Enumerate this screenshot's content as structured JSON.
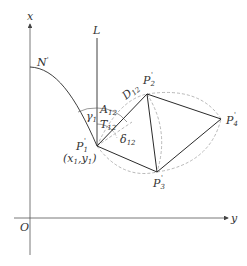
{
  "diagram": {
    "axes": {
      "x_label": "x",
      "y_label": "y",
      "origin_label": "O"
    },
    "reference_line": {
      "label": "L"
    },
    "curve": {
      "label": "N",
      "prime": "'"
    },
    "points": [
      {
        "id": "P1",
        "base": "P",
        "sub": "1",
        "prime": "'",
        "coord_label_x": "x",
        "coord_label_y": "y",
        "coord_sub": "1"
      },
      {
        "id": "P2",
        "base": "P",
        "sub": "2",
        "prime": "'"
      },
      {
        "id": "P3",
        "base": "P",
        "sub": "3",
        "prime": "'"
      },
      {
        "id": "P4",
        "base": "P",
        "sub": "4",
        "prime": "'"
      }
    ],
    "angles": {
      "gamma": {
        "base": "γ",
        "sub": "1"
      },
      "A": {
        "base": "A",
        "sub": "12"
      },
      "T": {
        "base": "T",
        "sub": "12"
      },
      "delta": {
        "base": "δ",
        "sub": "12"
      },
      "D": {
        "base": "D",
        "sub": "12"
      }
    },
    "colors": {
      "line": "#2a2a2a",
      "axis": "#555555",
      "dashed": "#999999",
      "text": "#333333"
    }
  }
}
